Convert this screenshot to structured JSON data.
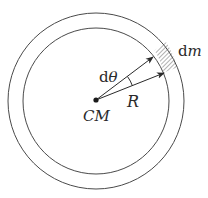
{
  "diagram": {
    "labels": {
      "dm_prefix": "d",
      "dm_var": "m",
      "dtheta_prefix": "d",
      "dtheta_var": "θ",
      "radius": "R",
      "center": "CM"
    },
    "geometry": {
      "center": [
        96,
        100
      ],
      "inner_radius": 73,
      "outer_radius": 88
    },
    "colors": {
      "stroke": "#4a4a4a",
      "text": "#2a2a2a",
      "background": "#ffffff"
    }
  }
}
